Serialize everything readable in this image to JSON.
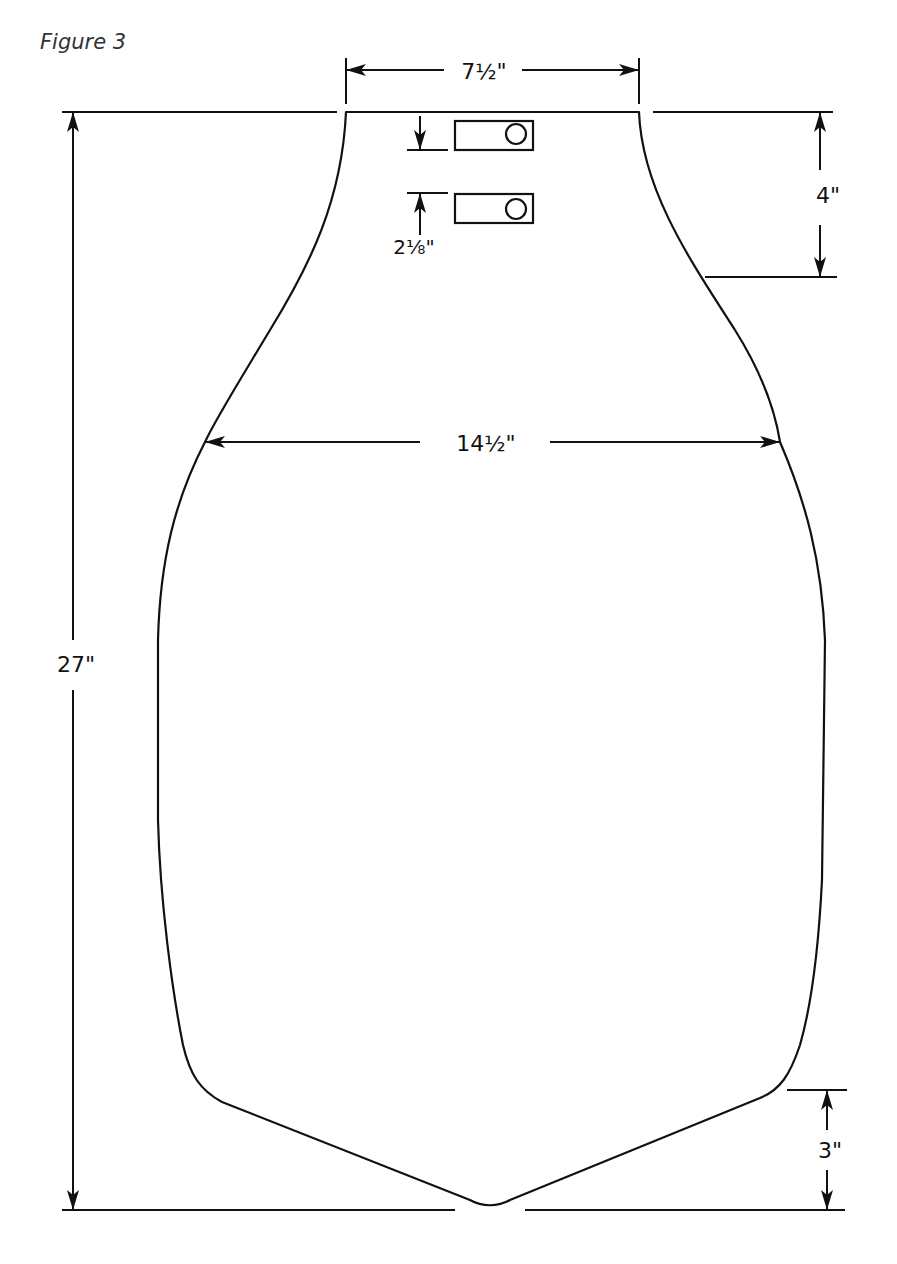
{
  "figure": {
    "title": "Figure 3",
    "line_color": "#111111",
    "background": "#ffffff"
  },
  "dimensions": {
    "top_width": "7½\"",
    "total_height": "27\"",
    "neck_depth": "4\"",
    "mid_width": "14½\"",
    "slot_spacing": "2⅛\"",
    "point_depth": "3\""
  },
  "slots": [
    {
      "name": "upper-slot",
      "has_circle": true
    },
    {
      "name": "lower-slot",
      "has_circle": true
    }
  ]
}
